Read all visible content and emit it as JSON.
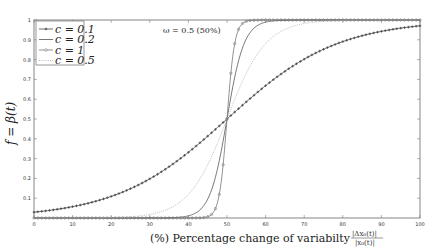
{
  "chart_data": {
    "type": "line",
    "title": "",
    "xlabel": "(%) Percentage change of variabilty |Δx_0(t)| / |x_0(t)|",
    "ylabel": "f = β(t)",
    "xlim": [
      0,
      100
    ],
    "ylim": [
      0,
      1
    ],
    "xticks": [
      0,
      10,
      20,
      30,
      40,
      50,
      60,
      70,
      80,
      90,
      100
    ],
    "yticks": [
      0.1,
      0.2,
      0.3,
      0.4,
      0.5,
      0.6,
      0.7,
      0.8,
      0.9,
      1
    ],
    "grid": false,
    "legend_position": "upper left",
    "annotation": {
      "text": "ω = 0.5 (50%)",
      "x": 35,
      "y": 0.95
    },
    "midpoint": 50,
    "series": [
      {
        "name": "c = 0.1",
        "style": "plus-markers",
        "color": "#444444",
        "steepness": 0.07
      },
      {
        "name": "c = 0.2",
        "style": "solid",
        "color": "#555555",
        "steepness": 0.45
      },
      {
        "name": "c = 1",
        "style": "circle-markers",
        "color": "#777777",
        "steepness": 1.0
      },
      {
        "name": "c = 0.5",
        "style": "dotted",
        "color": "#aaaaaa",
        "steepness": 0.2
      }
    ]
  },
  "labels": {
    "xlabel_text": "(%) Percentage change of variabilty",
    "xlabel_frac_num": "|Δx₀(t)|",
    "xlabel_frac_den": "|x₀(t)|",
    "ylabel": "f = β(t)",
    "annotation": "ω = 0.5 (50%)"
  }
}
